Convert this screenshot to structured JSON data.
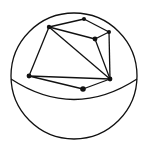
{
  "diagram": {
    "type": "sphere-with-graph",
    "stroke_color": "#111111",
    "background": "#ffffff",
    "sphere": {
      "cx": 74,
      "cy": 76,
      "r": 63
    },
    "equator": {
      "path": "M 11 79 Q 74 120 137 79"
    },
    "vertices": [
      {
        "id": "A",
        "x": 49,
        "y": 27,
        "r": 2.2
      },
      {
        "id": "B",
        "x": 84,
        "y": 19,
        "r": 2.0
      },
      {
        "id": "C",
        "x": 109,
        "y": 32,
        "r": 2.0
      },
      {
        "id": "D",
        "x": 95,
        "y": 39,
        "r": 2.4
      },
      {
        "id": "E",
        "x": 110,
        "y": 79,
        "r": 2.4
      },
      {
        "id": "F",
        "x": 83,
        "y": 89,
        "r": 2.8
      },
      {
        "id": "G",
        "x": 29,
        "y": 76,
        "r": 2.4
      }
    ],
    "edges": [
      [
        "A",
        "B"
      ],
      [
        "B",
        "C"
      ],
      [
        "C",
        "D"
      ],
      [
        "A",
        "D"
      ],
      [
        "C",
        "E"
      ],
      [
        "D",
        "E"
      ],
      [
        "A",
        "E"
      ],
      [
        "A",
        "G"
      ],
      [
        "G",
        "E"
      ],
      [
        "G",
        "F"
      ],
      [
        "F",
        "E"
      ]
    ]
  }
}
